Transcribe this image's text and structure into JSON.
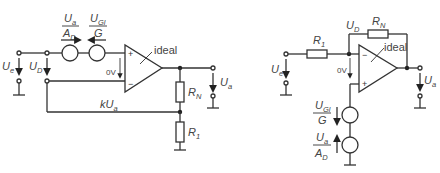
{
  "left_circuit": {
    "name": "non-inverting amplifier equivalent",
    "opamp_label": "ideal",
    "zero_volt_label": "0V",
    "input_voltage": {
      "main": "U",
      "sub": "e"
    },
    "diff_voltage": {
      "main": "U",
      "sub": "D"
    },
    "output_voltage": {
      "main": "U",
      "sub": "a"
    },
    "source1": {
      "num_main": "U",
      "num_sub": "a",
      "den_main": "A",
      "den_sub": "D"
    },
    "source2": {
      "num_main": "U",
      "num_sub": "Gl",
      "den_main": "G",
      "den_sub": ""
    },
    "feedback_label": {
      "prefix": "kU",
      "sub": "a"
    },
    "rn": {
      "main": "R",
      "sub": "N"
    },
    "r1": {
      "main": "R",
      "sub": "1"
    },
    "plus": "+",
    "minus": "−"
  },
  "right_circuit": {
    "name": "inverting amplifier equivalent",
    "opamp_label": "ideal",
    "zero_volt_label": "0V",
    "input_voltage": {
      "main": "U",
      "sub": "e"
    },
    "diff_voltage": {
      "main": "U",
      "sub": "D"
    },
    "output_voltage": {
      "main": "U",
      "sub": "a"
    },
    "source1": {
      "num_main": "U",
      "num_sub": "Gl",
      "den_main": "G",
      "den_sub": ""
    },
    "source2": {
      "num_main": "U",
      "num_sub": "a",
      "den_main": "A",
      "den_sub": "D"
    },
    "rn": {
      "main": "R",
      "sub": "N"
    },
    "r1": {
      "main": "R",
      "sub": "1"
    },
    "plus": "+",
    "minus": "−"
  }
}
